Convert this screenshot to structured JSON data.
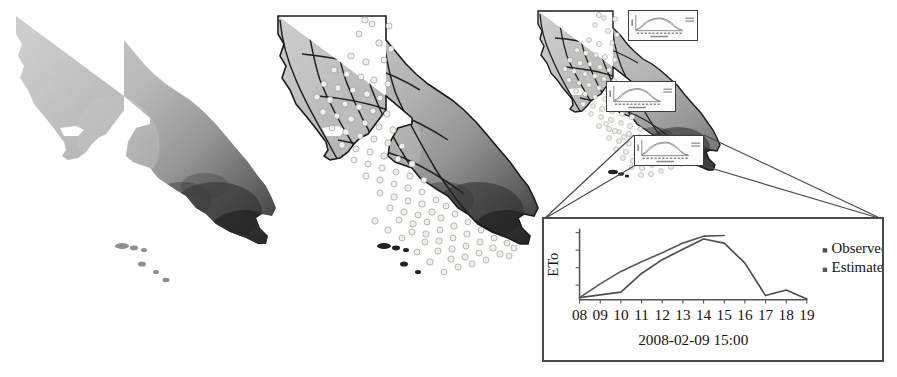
{
  "figure": {
    "panels": [
      {
        "id": "panel-a",
        "name": "statewide-eto-surface-map",
        "region": "California",
        "description": "Grayscale interpolated ETo surface"
      },
      {
        "id": "panel-b",
        "name": "eto-zones-with-stations-map",
        "region": "California",
        "description": "ETo zones with weather station points"
      },
      {
        "id": "panel-c",
        "name": "station-popups-map",
        "region": "California",
        "description": "Map with station time-series popups"
      }
    ]
  },
  "chart_data": {
    "type": "line",
    "title": "",
    "subtitle": "",
    "xlabel": "2008-02-09 15:00",
    "ylabel": "ETo",
    "x": [
      "08",
      "09",
      "10",
      "11",
      "12",
      "13",
      "14",
      "15",
      "16",
      "17",
      "18",
      "19"
    ],
    "tick_labels": [
      "08",
      "09",
      "10",
      "11",
      "12",
      "13",
      "14",
      "15",
      "16",
      "17",
      "18",
      "19"
    ],
    "xlim": [
      8,
      19
    ],
    "ylim": [
      0,
      1
    ],
    "grid": false,
    "legend_position": "right",
    "series": [
      {
        "name": "Observed",
        "color": "#4d4d4d",
        "marker": "square",
        "x": [
          8,
          9,
          10,
          11,
          12,
          13,
          14,
          15,
          16,
          17,
          18,
          19
        ],
        "values": [
          0.03,
          0.07,
          0.11,
          0.38,
          0.58,
          0.73,
          0.88,
          0.82,
          0.53,
          0.06,
          0.14,
          0.01
        ]
      },
      {
        "name": "Estimated",
        "color": "#595959",
        "marker": "square",
        "x": [
          8,
          9,
          10,
          11,
          12,
          13,
          14,
          15
        ],
        "values": [
          0.03,
          0.23,
          0.41,
          0.55,
          0.68,
          0.82,
          0.92,
          0.93
        ]
      }
    ],
    "legend": [
      {
        "label": "Observed",
        "color": "#4d4d4d",
        "marker": "square"
      },
      {
        "label": "Estimated",
        "color": "#595959",
        "marker": "square"
      }
    ]
  },
  "popups": [
    {
      "id": "popup-1",
      "name": "station-popup-north",
      "chart": {
        "type": "line",
        "ylabel": "ETo",
        "xlabel": "2008-02-09",
        "legend": [
          "Observed",
          "Estimated"
        ]
      }
    },
    {
      "id": "popup-2",
      "name": "station-popup-central",
      "chart": {
        "type": "line",
        "ylabel": "ETo",
        "xlabel": "2008-02-09",
        "legend": [
          "Observed",
          "Estimated"
        ]
      }
    },
    {
      "id": "popup-3",
      "name": "station-popup-south",
      "chart": {
        "type": "line",
        "ylabel": "ETo",
        "xlabel": "2008-02-09",
        "legend": [
          "Observed",
          "Estimated"
        ]
      }
    }
  ],
  "colors": {
    "frame": "#4a4a4a",
    "axis": "#555555",
    "text": "#141414",
    "observed": "#4d4d4d",
    "estimated": "#595959",
    "station_dot": "#efefe8",
    "zone_line": "#2b2b2b"
  }
}
